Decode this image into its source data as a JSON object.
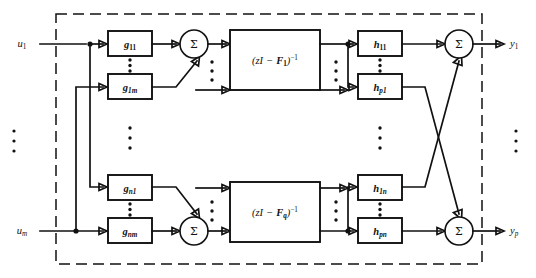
{
  "figure": {
    "boundary_style": "dashed"
  },
  "inputs": [
    {
      "id": "u1",
      "label": "u",
      "sub": "1",
      "x": 26,
      "y": 44
    },
    {
      "id": "um",
      "label": "u",
      "sub": "m",
      "x": 26,
      "y": 230
    }
  ],
  "outputs": [
    {
      "id": "y1",
      "label": "y",
      "sub": "1",
      "x": 508,
      "y": 44
    },
    {
      "id": "yp",
      "label": "y",
      "sub": "p",
      "x": 508,
      "y": 230
    }
  ],
  "input_gain_blocks": [
    {
      "id": "g11",
      "label": "g",
      "sub": "11",
      "x": 108,
      "y": 31,
      "w": 44,
      "h": 25
    },
    {
      "id": "g1m",
      "label": "g",
      "sub": "1m",
      "x": 108,
      "y": 74,
      "w": 44,
      "h": 25
    },
    {
      "id": "gn1",
      "label": "g",
      "sub": "n1",
      "x": 108,
      "y": 175,
      "w": 44,
      "h": 25
    },
    {
      "id": "gnm",
      "label": "g",
      "sub": "nm",
      "x": 108,
      "y": 218,
      "w": 44,
      "h": 25
    }
  ],
  "output_gain_blocks": [
    {
      "id": "h11",
      "label": "h",
      "sub": "11",
      "x": 358,
      "y": 31,
      "w": 44,
      "h": 25
    },
    {
      "id": "hp1",
      "label": "h",
      "sub": "p1",
      "x": 358,
      "y": 74,
      "w": 44,
      "h": 25
    },
    {
      "id": "h1n",
      "label": "h",
      "sub": "1n",
      "x": 358,
      "y": 175,
      "w": 44,
      "h": 25
    },
    {
      "id": "hpn",
      "label": "h",
      "sub": "pn",
      "x": 358,
      "y": 218,
      "w": 44,
      "h": 25
    }
  ],
  "transfer_blocks": [
    {
      "id": "tf1",
      "text_prefix": "(zI",
      "text_minus": "−",
      "text_matrix": "F",
      "text_matrix_sub": "1",
      "text_suffix": ")",
      "text_exp": "−1",
      "full": "(zI − F₁)⁻¹",
      "x": 230,
      "y": 30,
      "w": 90,
      "h": 60
    },
    {
      "id": "tfq",
      "text_prefix": "(zI",
      "text_minus": "−",
      "text_matrix": "F",
      "text_matrix_sub": "q",
      "text_suffix": ")",
      "text_exp": "−1",
      "full": "(zI − F_q)⁻¹",
      "x": 230,
      "y": 182,
      "w": 90,
      "h": 60
    }
  ],
  "summers": [
    {
      "id": "sum-top-left",
      "label": "Σ",
      "cx": 194,
      "cy": 44,
      "r": 14
    },
    {
      "id": "sum-bottom-left",
      "label": "Σ",
      "cx": 194,
      "cy": 231,
      "r": 14
    },
    {
      "id": "sum-top-right",
      "label": "Σ",
      "cx": 459,
      "cy": 44,
      "r": 14
    },
    {
      "id": "sum-bottom-right",
      "label": "Σ",
      "cx": 459,
      "cy": 231,
      "r": 14
    }
  ],
  "vertical_ellipses": [
    {
      "id": "ellipsis-left-outside",
      "cx": 14,
      "cy": 140
    },
    {
      "id": "ellipsis-g-column",
      "cx": 130,
      "cy": 137
    },
    {
      "id": "ellipsis-tf-in-top",
      "cx": 212,
      "cy": 72
    },
    {
      "id": "ellipsis-tf-out-top",
      "cx": 338,
      "cy": 72
    },
    {
      "id": "ellipsis-tf-in-bottom",
      "cx": 212,
      "cy": 212
    },
    {
      "id": "ellipsis-tf-out-bottom",
      "cx": 338,
      "cy": 212
    },
    {
      "id": "ellipsis-h-column",
      "cx": 380,
      "cy": 137
    },
    {
      "id": "ellipsis-right-outside",
      "cx": 516,
      "cy": 140
    }
  ],
  "inline_ellipses": [
    {
      "id": "ellipsis-g11-g1m",
      "cx": 130,
      "cy": 65
    },
    {
      "id": "ellipsis-gn1-gnm",
      "cx": 130,
      "cy": 209
    },
    {
      "id": "ellipsis-h11-hp1",
      "cx": 380,
      "cy": 65
    },
    {
      "id": "ellipsis-h1n-hpn",
      "cx": 380,
      "cy": 209
    }
  ],
  "boundary": {
    "x": 56,
    "y": 14,
    "w": 426,
    "h": 250
  },
  "colors": {
    "line": "#111111",
    "background": "#ffffff",
    "block_fill": "#ffffff"
  }
}
